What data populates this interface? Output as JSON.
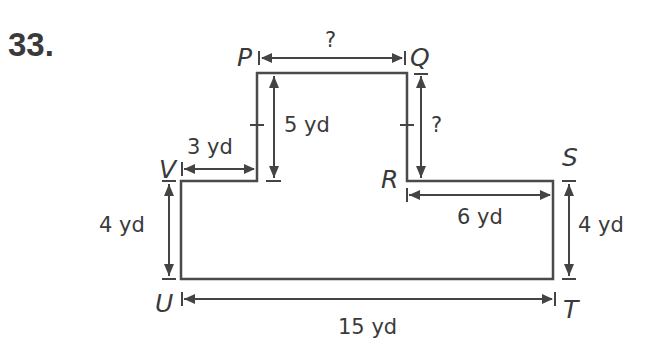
{
  "problem_number": "33.",
  "vertices": {
    "P": "P",
    "Q": "Q",
    "R": "R",
    "S": "S",
    "T": "T",
    "U": "U",
    "V": "V"
  },
  "dimensions": {
    "PQ": "?",
    "QR": "?",
    "P_to_V_height": "5 yd",
    "V_to_P_width": "3 yd",
    "R_to_S": "6 yd",
    "V_to_U": "4 yd",
    "S_to_T": "4 yd",
    "U_to_T": "15 yd"
  },
  "colors": {
    "stroke": "#4a4a4a",
    "text": "#3a3a3a",
    "background": "#ffffff"
  }
}
